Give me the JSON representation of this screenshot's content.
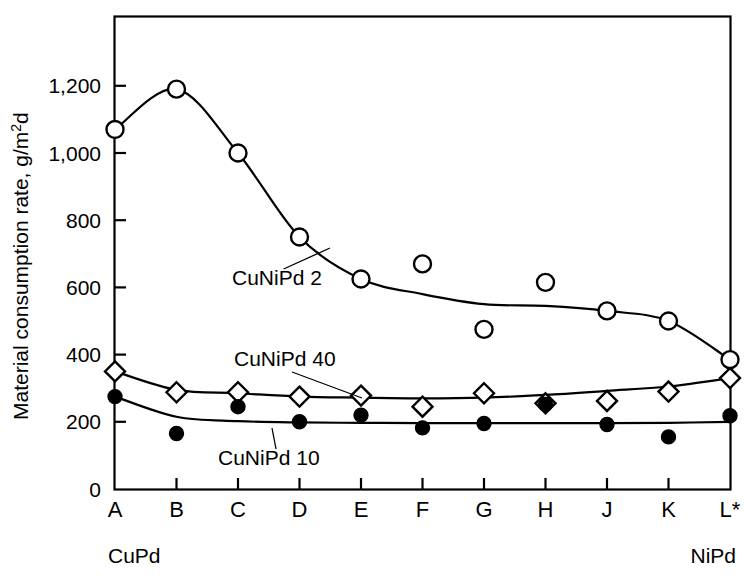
{
  "chart_data": {
    "type": "line",
    "title": "",
    "xlabel": "",
    "ylabel": "Material consumption rate, g/m2d",
    "ylabel_parts": {
      "main": "Material consumption rate, g/m",
      "sup": "2",
      "tail": "d"
    },
    "categories": [
      "A",
      "B",
      "C",
      "D",
      "E",
      "F",
      "G",
      "H",
      "J",
      "K",
      "L*"
    ],
    "x_end_labels": {
      "left": "CuPd",
      "right": "NiPd"
    },
    "ylim": [
      0,
      1300
    ],
    "ytick_values": [
      0,
      200,
      400,
      600,
      800,
      1000,
      1200
    ],
    "ytick_labels": [
      "0",
      "200",
      "400",
      "600",
      "800",
      "1,000",
      "1,200"
    ],
    "grid": false,
    "legend_position": "inline-annotations",
    "series": [
      {
        "name": "CuNiPd 2",
        "marker": "open-circle",
        "color": "#000000",
        "values": [
          1070,
          1190,
          1000,
          750,
          625,
          670,
          475,
          615,
          530,
          500,
          385
        ],
        "fit_curve": [
          1070,
          1190,
          1000,
          750,
          625,
          580,
          550,
          545,
          530,
          500,
          385
        ]
      },
      {
        "name": "CuNiPd 40",
        "marker": "open-diamond",
        "color": "#000000",
        "values": [
          350,
          288,
          288,
          275,
          278,
          245,
          285,
          255,
          262,
          290,
          330
        ],
        "fit_curve": [
          350,
          295,
          285,
          275,
          272,
          270,
          272,
          280,
          292,
          305,
          330
        ]
      },
      {
        "name": "CuNiPd 10",
        "marker": "filled-circle",
        "color": "#000000",
        "values": [
          275,
          165,
          245,
          200,
          220,
          182,
          195,
          252,
          192,
          155,
          218
        ],
        "fit_curve": [
          275,
          215,
          202,
          198,
          197,
          196,
          196,
          196,
          196,
          197,
          200
        ]
      }
    ],
    "annotations": [
      {
        "label": "CuNiPd 2",
        "text_x": 232,
        "text_y": 285,
        "leader_to_x": 330,
        "leader_to_y": 248
      },
      {
        "label": "CuNiPd 40",
        "text_x": 234,
        "text_y": 366,
        "leader_to_x": 362,
        "leader_to_y": 398
      },
      {
        "label": "CuNiPd 10",
        "text_x": 218,
        "text_y": 465,
        "leader_to_x": 272,
        "leader_to_y": 428
      }
    ]
  }
}
